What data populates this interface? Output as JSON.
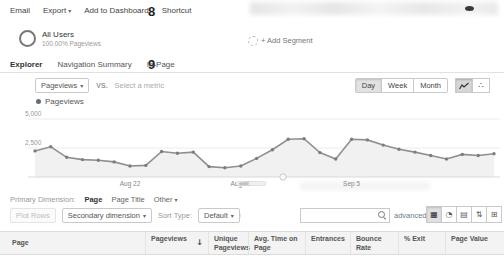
{
  "annotations": {
    "n8": "8",
    "n9": "9",
    "n10": "10",
    "n11": "11"
  },
  "icons": {
    "caret_down": "▾",
    "sort_desc": "↓",
    "motion_chart": "∴",
    "view_table": "▦",
    "view_percentage": "◔",
    "view_performance": "▤",
    "view_comparison": "⇅",
    "view_pivot": "⊞"
  },
  "action_bar": {
    "email": "Email",
    "export": "Export",
    "add_to_dashboard": "Add to Dashboard",
    "shortcut": "Shortcut"
  },
  "segment_bar": {
    "all_users_title": "All Users",
    "all_users_subtitle": "100.00% Pageviews",
    "add_segment": "+ Add Segment"
  },
  "tabs": [
    {
      "label": "Explorer",
      "active": true
    },
    {
      "label": "Navigation Summary",
      "active": false
    },
    {
      "label": "In-Page",
      "active": false
    }
  ],
  "metric_bar": {
    "metric_selector": "Pageviews",
    "vs": "VS.",
    "select_a_metric": "Select a metric",
    "granularity": [
      {
        "label": "Day",
        "selected": true
      },
      {
        "label": "Week",
        "selected": false
      },
      {
        "label": "Month",
        "selected": false
      }
    ]
  },
  "chart_data": {
    "type": "line",
    "legend": "Pageviews",
    "legend_position": "top-left",
    "series": [
      {
        "name": "Pageviews",
        "values": [
          2250,
          2600,
          1700,
          1500,
          1450,
          1300,
          950,
          1000,
          2200,
          2050,
          2150,
          900,
          800,
          950,
          1600,
          2350,
          3250,
          3300,
          2100,
          1550,
          3250,
          3200,
          2750,
          2400,
          2150,
          1850,
          1550,
          1950,
          1850,
          2000
        ]
      }
    ],
    "x_ticks": [
      {
        "label": "Aug 22",
        "index": 6
      },
      {
        "label": "Aug 29",
        "index": 13
      },
      {
        "label": "Sep 5",
        "index": 20
      }
    ],
    "ylim": [
      0,
      5000
    ],
    "yticks": [
      2500,
      5000
    ],
    "ytick_labels": [
      "2,500",
      "5,000"
    ],
    "grid": true,
    "colors": {
      "line": "#8f8f8f",
      "area": "#f1f1f1",
      "marker": "#7d7d7d",
      "legend_dot": "#5f6e7c"
    }
  },
  "dimension_bar": {
    "label": "Primary Dimension:",
    "options": [
      {
        "label": "Page",
        "active": true
      },
      {
        "label": "Page Title",
        "active": false
      },
      {
        "label": "Other",
        "active": false
      }
    ]
  },
  "toolbar": {
    "plot_rows": "Plot Rows",
    "secondary_dimension": "Secondary dimension",
    "sort_type_label": "Sort Type:",
    "sort_type_value": "Default",
    "search_value": "",
    "advanced": "advanced",
    "view_buttons": [
      {
        "name": "table",
        "selected": true
      },
      {
        "name": "percentage",
        "selected": false
      },
      {
        "name": "performance",
        "selected": false
      },
      {
        "name": "comparison",
        "selected": false
      },
      {
        "name": "pivot",
        "selected": false
      }
    ]
  },
  "table": {
    "columns": [
      {
        "label": "Page"
      },
      {
        "label": "Pageviews",
        "sorted": "descending"
      },
      {
        "label": "Unique Pageviews"
      },
      {
        "label": "Avg. Time on Page"
      },
      {
        "label": "Entrances"
      },
      {
        "label": "Bounce Rate"
      },
      {
        "label": "% Exit"
      },
      {
        "label": "Page Value"
      }
    ]
  }
}
